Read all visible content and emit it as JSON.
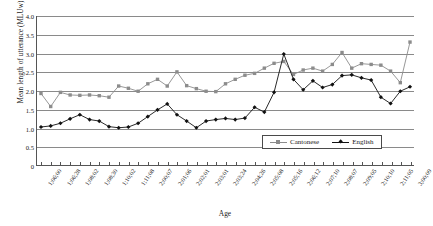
{
  "chart_data": {
    "type": "line",
    "title": "",
    "xlabel": "Age",
    "ylabel": "Mean length of utterance (MLUw)",
    "ylim": [
      0,
      4.0
    ],
    "yticks": [
      "0",
      "0.5",
      "1.0",
      "1.5",
      "2.0",
      "2.5",
      "3.0",
      "3.5",
      "4.0"
    ],
    "ytick_values": [
      0,
      0.5,
      1.0,
      1.5,
      2.0,
      2.5,
      3.0,
      3.5,
      4.0
    ],
    "grid": true,
    "legend_position": "bottom-right",
    "categories": [
      "1;06;00",
      "1;06;14",
      "1;06;28",
      "1;07;15",
      "1;08;02",
      "1;08;16",
      "1;08;30",
      "1;09;13",
      "1;10;02",
      "1;10;18",
      "1;11;08",
      "1;11;22",
      "2;00;07",
      "2;00;22",
      "2;01;06",
      "2;01;20",
      "2;02;01",
      "2;02;15",
      "2;03;01",
      "2;03;12",
      "2;03;24",
      "2;04;10",
      "2;04;26",
      "2;05;08",
      "2;05;22",
      "2;06;02",
      "2;06;16",
      "2;06;28",
      "2;07;10",
      "2;07;24",
      "2;08;07",
      "2;08;20",
      "2;09;05",
      "2;09;18",
      "2;10;10",
      "2;10;24",
      "2;11;05",
      "2;11;20",
      "3;00;09"
    ],
    "xtick_labels": [
      "1;06;00",
      "1;06;28",
      "1;08;02",
      "1;08;30",
      "1;10;02",
      "1;11;08",
      "2;00;07",
      "2;01;06",
      "2;02;01",
      "2;03;01",
      "2;03;24",
      "2;04;26",
      "2;05;08",
      "2;05;16",
      "2;06;12",
      "2;07;10",
      "2;08;07",
      "2;09;05",
      "2;10;10",
      "2;11;05",
      "3;00;09"
    ],
    "series": [
      {
        "name": "Cantonese",
        "marker": "square",
        "color": "#8c8c8c",
        "values": [
          1.92,
          1.57,
          1.95,
          1.88,
          1.87,
          1.88,
          1.86,
          1.82,
          2.12,
          2.06,
          1.98,
          2.18,
          2.3,
          2.12,
          2.5,
          2.13,
          2.05,
          1.98,
          1.97,
          2.18,
          2.3,
          2.41,
          2.46,
          2.6,
          2.73,
          2.78,
          2.43,
          2.55,
          2.6,
          2.52,
          2.7,
          3.02,
          2.6,
          2.72,
          2.7,
          2.68,
          2.52,
          2.21,
          3.3
        ]
      },
      {
        "name": "English",
        "marker": "diamond",
        "color": "#111111",
        "values": [
          1.02,
          1.05,
          1.12,
          1.24,
          1.35,
          1.22,
          1.18,
          1.03,
          1.0,
          1.02,
          1.12,
          1.3,
          1.48,
          1.64,
          1.35,
          1.18,
          1.0,
          1.18,
          1.22,
          1.25,
          1.22,
          1.26,
          1.55,
          1.42,
          1.95,
          2.98,
          2.3,
          2.02,
          2.26,
          2.08,
          2.16,
          2.4,
          2.42,
          2.34,
          2.28,
          1.82,
          1.65,
          1.98,
          2.1
        ]
      }
    ]
  },
  "legend": {
    "entries": [
      {
        "label": "Cantonese"
      },
      {
        "label": "English"
      }
    ]
  }
}
